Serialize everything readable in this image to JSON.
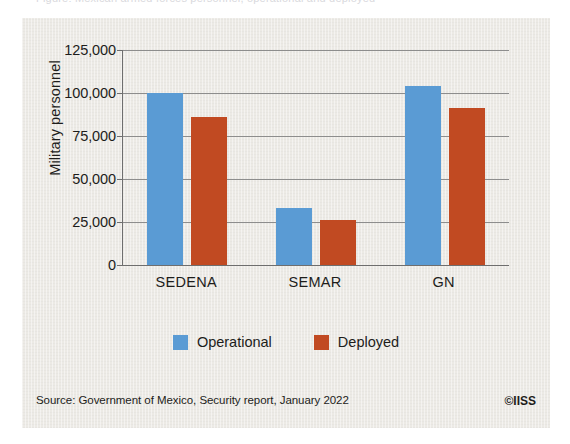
{
  "figure": {
    "panel_background": "#eceae5",
    "cut_off_caption": "Figure: Mexican armed forces personnel, operational and deployed"
  },
  "chart_data": {
    "type": "bar",
    "title": "",
    "xlabel": "",
    "ylabel": "Military personnel",
    "categories": [
      "SEDENA",
      "SEMAR",
      "GN"
    ],
    "series": [
      {
        "name": "Operational",
        "color": "#5a9bd4",
        "values": [
          100000,
          33000,
          104000
        ]
      },
      {
        "name": "Deployed",
        "color": "#c14a22",
        "values": [
          86000,
          26000,
          91000
        ]
      }
    ],
    "ylim": [
      0,
      125000
    ],
    "yticks": [
      0,
      25000,
      50000,
      75000,
      100000,
      125000
    ],
    "ytick_labels": [
      "0",
      "25,000",
      "50,000",
      "75,000",
      "100,000",
      "125,000"
    ],
    "grid": true,
    "legend_position": "bottom"
  },
  "legend": {
    "items": [
      {
        "label": "Operational",
        "color": "#5a9bd4"
      },
      {
        "label": "Deployed",
        "color": "#c14a22"
      }
    ]
  },
  "footer": {
    "source": "Source: Government of Mexico, Security report, January 2022",
    "copyright": "©IISS"
  }
}
